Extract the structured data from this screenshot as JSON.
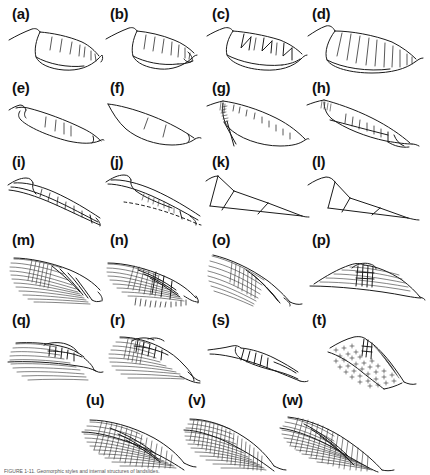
{
  "figure": {
    "title_caption": "FIGURE 1-11.  Geomorphic styles and internal structures of landslides.",
    "background_color": "#ffffff",
    "ink_color": "#1a1a1a",
    "panel_count": 23,
    "rows": [
      {
        "row_index": 0,
        "labels": [
          "(a)",
          "(b)",
          "(c)",
          "(d)"
        ]
      },
      {
        "row_index": 1,
        "labels": [
          "(e)",
          "(f)",
          "(g)",
          "(h)"
        ]
      },
      {
        "row_index": 2,
        "labels": [
          "(i)",
          "(j)",
          "(k)",
          "(l)"
        ]
      },
      {
        "row_index": 3,
        "labels": [
          "(m)",
          "(n)",
          "(o)",
          "(p)"
        ]
      },
      {
        "row_index": 4,
        "labels": [
          "(q)",
          "(r)",
          "(s)",
          "(t)"
        ]
      },
      {
        "row_index": 5,
        "labels": [
          "(u)",
          "(v)",
          "(w)"
        ]
      }
    ],
    "panels": [
      {
        "id": "a",
        "label": "(a)",
        "x": 6,
        "y": 6,
        "w": 100,
        "h": 72,
        "style": "slump-ribbed-few",
        "description": "slump block with few internal shear ribs"
      },
      {
        "id": "b",
        "label": "(b)",
        "x": 104,
        "y": 6,
        "w": 100,
        "h": 72,
        "style": "slump-ribbed-more",
        "description": "slump with more internal ribs and toe bulge"
      },
      {
        "id": "c",
        "label": "(c)",
        "x": 206,
        "y": 6,
        "w": 100,
        "h": 72,
        "style": "slump-wedges",
        "description": "slump with triangular wedge blocks"
      },
      {
        "id": "d",
        "label": "(d)",
        "x": 306,
        "y": 6,
        "w": 118,
        "h": 72,
        "style": "slump-many-ribs",
        "description": "deep slump with many steep internal ribs"
      },
      {
        "id": "e",
        "label": "(e)",
        "x": 6,
        "y": 78,
        "w": 100,
        "h": 72,
        "style": "thin-slab-ribs",
        "description": "thin translational slab with short ribs"
      },
      {
        "id": "f",
        "label": "(f)",
        "x": 104,
        "y": 78,
        "w": 100,
        "h": 72,
        "style": "open-lens-two-ribs",
        "description": "open lens shape with two ribs"
      },
      {
        "id": "g",
        "label": "(g)",
        "x": 206,
        "y": 78,
        "w": 100,
        "h": 72,
        "style": "crown-cracks-long",
        "description": "long runout with crown crack zone"
      },
      {
        "id": "h",
        "label": "(h)",
        "x": 306,
        "y": 78,
        "w": 118,
        "h": 72,
        "style": "crown-cracks-toe-block",
        "description": "crown cracks with displaced toe block"
      },
      {
        "id": "i",
        "label": "(i)",
        "x": 6,
        "y": 154,
        "w": 100,
        "h": 76,
        "style": "thin-elongate-shear",
        "description": "very elongate thin shear zone"
      },
      {
        "id": "j",
        "label": "(j)",
        "x": 104,
        "y": 154,
        "w": 100,
        "h": 76,
        "style": "elongate-dashed-base",
        "description": "elongate slide with dashed basal surface"
      },
      {
        "id": "k",
        "label": "(k)",
        "x": 206,
        "y": 154,
        "w": 100,
        "h": 76,
        "style": "block-triangles-a",
        "description": "translational blocks, triangular facets"
      },
      {
        "id": "l",
        "label": "(l)",
        "x": 306,
        "y": 154,
        "w": 118,
        "h": 76,
        "style": "block-triangles-b",
        "description": "translational blocks, stepped facets"
      },
      {
        "id": "m",
        "label": "(m)",
        "x": 6,
        "y": 232,
        "w": 100,
        "h": 78,
        "style": "hatched-slab-dense",
        "description": "densely line-hatched slab"
      },
      {
        "id": "n",
        "label": "(n)",
        "x": 104,
        "y": 232,
        "w": 100,
        "h": 78,
        "style": "hatched-ribbed-toe",
        "description": "hatched slab with ribbed toe fringe"
      },
      {
        "id": "o",
        "label": "(o)",
        "x": 206,
        "y": 232,
        "w": 100,
        "h": 78,
        "style": "hatched-fan",
        "description": "fan of long hatch lines"
      },
      {
        "id": "p",
        "label": "(p)",
        "x": 306,
        "y": 232,
        "w": 118,
        "h": 78,
        "style": "ridge-graben",
        "description": "ridge with central graben blocks"
      },
      {
        "id": "q",
        "label": "(q)",
        "x": 6,
        "y": 312,
        "w": 100,
        "h": 78,
        "style": "stacked-layers-blocks",
        "description": "stacked layering with crest blocks"
      },
      {
        "id": "r",
        "label": "(r)",
        "x": 104,
        "y": 312,
        "w": 100,
        "h": 78,
        "style": "stacked-layers-steps",
        "description": "stacked layering with stepped crest"
      },
      {
        "id": "s",
        "label": "(s)",
        "x": 206,
        "y": 312,
        "w": 100,
        "h": 78,
        "style": "thin-wedge-ribs",
        "description": "thin wedge with fine ribs"
      },
      {
        "id": "t",
        "label": "(t)",
        "x": 306,
        "y": 312,
        "w": 118,
        "h": 78,
        "style": "crystalline-cross-fill",
        "description": "crystalline bedrock with plus-symbol fill"
      },
      {
        "id": "u",
        "label": "(u)",
        "x": 80,
        "y": 392,
        "w": 118,
        "h": 80,
        "style": "dense-fabric-a",
        "description": "dense cross-hatched deformed mass"
      },
      {
        "id": "v",
        "label": "(v)",
        "x": 182,
        "y": 392,
        "w": 118,
        "h": 80,
        "style": "dense-fabric-b",
        "description": "very dense stipple-hatched mass"
      },
      {
        "id": "w",
        "label": "(w)",
        "x": 276,
        "y": 392,
        "w": 140,
        "h": 80,
        "style": "dense-fabric-c",
        "description": "inclined dense-hatched mass"
      }
    ]
  }
}
